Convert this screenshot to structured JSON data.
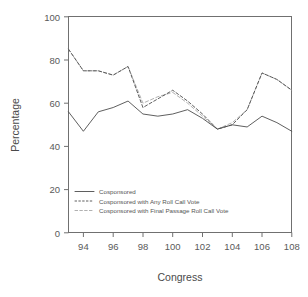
{
  "chart_data": {
    "type": "line",
    "title": "",
    "xlabel": "Congress",
    "ylabel": "Percentage",
    "xlim": [
      93,
      108
    ],
    "ylim": [
      0,
      100
    ],
    "grid": false,
    "legend_position": "inside-lower-left",
    "x": [
      93,
      94,
      95,
      96,
      97,
      98,
      99,
      100,
      101,
      102,
      103,
      104,
      105,
      106,
      107,
      108
    ],
    "xticks": [
      94,
      96,
      98,
      100,
      102,
      104,
      106,
      108
    ],
    "yticks": [
      0,
      20,
      40,
      60,
      80,
      100
    ],
    "series": [
      {
        "name": "Cosponsored",
        "style": "solid",
        "color": "#4d4d4d",
        "values": [
          56,
          47,
          56,
          58,
          61,
          55,
          54,
          55,
          57,
          53,
          48,
          50,
          49,
          54,
          51,
          47
        ]
      },
      {
        "name": "Cosponsored with Any Roll Call Vote",
        "style": "dashed",
        "color": "#4d4d4d",
        "values": [
          85,
          75,
          75,
          73,
          77,
          58,
          62,
          66,
          61,
          55,
          48,
          50,
          57,
          74,
          71,
          66
        ]
      },
      {
        "name": "Cosponsored with Final Passage Roll Call Vote",
        "style": "dashed-light",
        "color": "#a8a8a8",
        "values": [
          85,
          75,
          75,
          73,
          77,
          60,
          63,
          65,
          60,
          54,
          48,
          51,
          57,
          74,
          71,
          66
        ]
      }
    ]
  },
  "axes": {
    "x_title": "Congress",
    "y_title": "Percentage",
    "x_tick_labels": [
      "94",
      "96",
      "98",
      "100",
      "102",
      "104",
      "106",
      "108"
    ],
    "y_tick_labels": [
      "0",
      "20",
      "40",
      "60",
      "80",
      "100"
    ]
  },
  "legend": {
    "entries": [
      {
        "label": "Cosponsored"
      },
      {
        "label": "Cosponsored with Any Roll Call Vote"
      },
      {
        "label": "Cosponsored with Final Passage Roll Call Vote"
      }
    ]
  }
}
